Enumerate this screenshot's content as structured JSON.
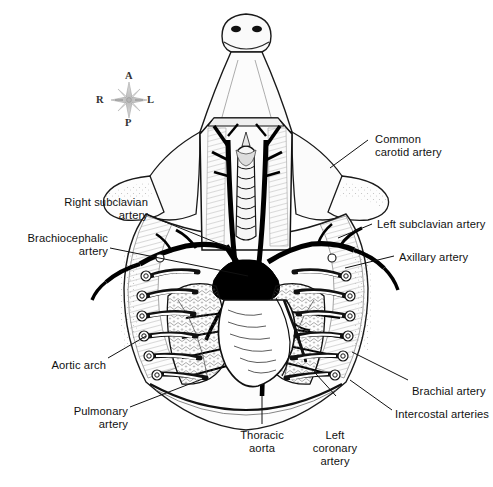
{
  "figure": {
    "background_color": "#ffffff",
    "ink_color": "#000000",
    "label_color": "#111111"
  },
  "compass": {
    "name": "orientation-compass",
    "anterior": "A",
    "right": "R",
    "left": "L",
    "posterior": "P",
    "color": "#888888"
  },
  "labels": [
    {
      "id": "common-carotid-artery",
      "text": "Common\ncarotid artery",
      "align": "left",
      "x": 375,
      "y": 133
    },
    {
      "id": "right-subclavian-artery",
      "text": "Right subclavian\nartery",
      "align": "right",
      "x": 60,
      "y": 196
    },
    {
      "id": "left-subclavian-artery",
      "text": "Left subclavian artery",
      "align": "left",
      "x": 377,
      "y": 218
    },
    {
      "id": "brachiocephalic-artery",
      "text": "Brachiocephalic\nartery",
      "align": "right",
      "x": 14,
      "y": 232
    },
    {
      "id": "axillary-artery",
      "text": "Axillary artery",
      "align": "left",
      "x": 399,
      "y": 251
    },
    {
      "id": "aortic-arch",
      "text": "Aortic arch",
      "align": "right",
      "x": 40,
      "y": 359
    },
    {
      "id": "brachial-artery",
      "text": "Brachial artery",
      "align": "left",
      "x": 412,
      "y": 385
    },
    {
      "id": "pulmonary-artery",
      "text": "Pulmonary\nartery",
      "align": "right",
      "x": 62,
      "y": 405
    },
    {
      "id": "intercostal-arteries",
      "text": "Intercostal arteries",
      "align": "left",
      "x": 395,
      "y": 408
    },
    {
      "id": "thoracic-aorta",
      "text": "Thoracic\naorta",
      "align": "center",
      "x": 240,
      "y": 429
    },
    {
      "id": "left-coronary-artery",
      "text": "Left\ncoronary\nartery",
      "align": "center",
      "x": 330,
      "y": 429
    }
  ],
  "leaders": [
    {
      "id": "leader-common-carotid",
      "points": "368,140 330,168"
    },
    {
      "id": "leader-right-subclavian",
      "points": "148,215 232,249"
    },
    {
      "id": "leader-left-subclavian",
      "points": "372,224 338,238"
    },
    {
      "id": "leader-brachiocephalic",
      "points": "110,248 248,276"
    },
    {
      "id": "leader-axillary",
      "points": "394,256 345,268"
    },
    {
      "id": "leader-aortic-arch",
      "points": "108,358 146,336"
    },
    {
      "id": "leader-brachial",
      "points": "408,380 352,352"
    },
    {
      "id": "leader-pulmonary",
      "points": "130,407 205,378"
    },
    {
      "id": "leader-intercostal",
      "points": "392,410 350,380"
    },
    {
      "id": "leader-thoracic-aorta",
      "points": "262,396 262,424"
    },
    {
      "id": "leader-left-coronary",
      "points": "336,396 316,374"
    }
  ],
  "structures": [
    {
      "id": "head",
      "label": "head and chin"
    },
    {
      "id": "trachea",
      "label": "trachea"
    },
    {
      "id": "thymus",
      "label": "thymus"
    },
    {
      "id": "heart",
      "label": "heart"
    },
    {
      "id": "lungs",
      "label": "lungs"
    },
    {
      "id": "rib-cage",
      "label": "rib cage"
    },
    {
      "id": "diaphragm",
      "label": "diaphragm"
    },
    {
      "id": "forelimbs",
      "label": "forelimbs"
    }
  ]
}
